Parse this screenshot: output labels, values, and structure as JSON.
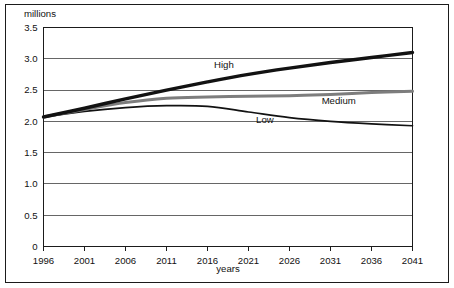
{
  "chart_data": {
    "type": "line",
    "title": "",
    "xlabel": "years",
    "ylabel": "millions",
    "unit_label": "millions",
    "grid": true,
    "legend_position": "inline-labels",
    "x": [
      1996,
      2001,
      2006,
      2011,
      2016,
      2021,
      2026,
      2031,
      2036,
      2041
    ],
    "xlim": [
      1996,
      2041
    ],
    "ylim": [
      0,
      3.5
    ],
    "yticks": [
      "0",
      "0.5",
      "1.0",
      "1.5",
      "2.0",
      "2.5",
      "3.0",
      "3.5"
    ],
    "ytick_values": [
      0,
      0.5,
      1.0,
      1.5,
      2.0,
      2.5,
      3.0,
      3.5
    ],
    "xticks": [
      "1996",
      "2001",
      "2006",
      "2011",
      "2016",
      "2021",
      "2026",
      "2031",
      "2036",
      "2041"
    ],
    "series": [
      {
        "name": "High",
        "color": "#121212",
        "width": 3.4,
        "label_x": 2018,
        "label_y": 2.86,
        "values": [
          2.07,
          2.21,
          2.36,
          2.5,
          2.63,
          2.75,
          2.85,
          2.94,
          3.02,
          3.1
        ]
      },
      {
        "name": "Medium",
        "color": "#7d7d7d",
        "width": 3.0,
        "label_x": 2032,
        "label_y": 2.28,
        "values": [
          2.07,
          2.19,
          2.3,
          2.37,
          2.39,
          2.4,
          2.41,
          2.43,
          2.46,
          2.48
        ]
      },
      {
        "name": "Low",
        "color": "#121212",
        "width": 1.7,
        "label_x": 2023,
        "label_y": 1.97,
        "values": [
          2.07,
          2.16,
          2.22,
          2.25,
          2.24,
          2.15,
          2.06,
          2.0,
          1.96,
          1.93
        ]
      }
    ]
  },
  "colors": {
    "frame": "#1b1b1b",
    "gridline": "#555555",
    "background": "#ffffff",
    "high": "#121212",
    "medium": "#7d7d7d",
    "low": "#121212"
  }
}
